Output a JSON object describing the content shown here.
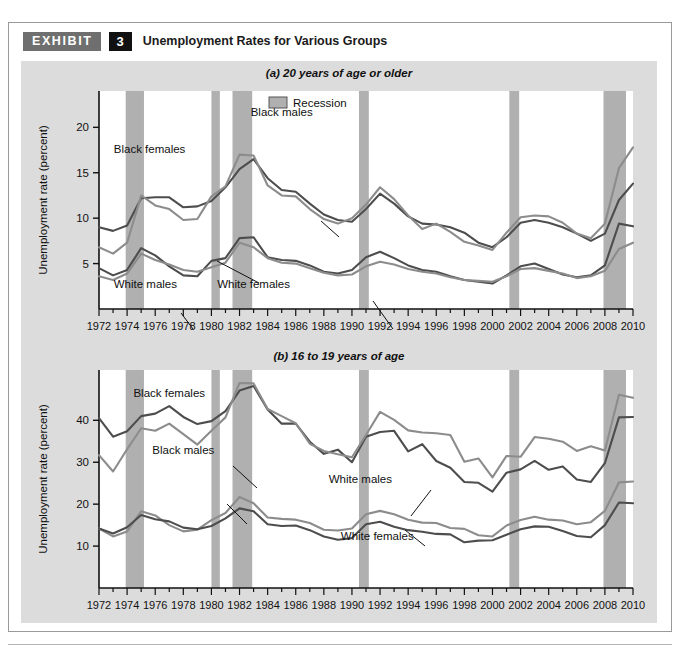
{
  "exhibit": {
    "badge_label": "EXHIBIT",
    "number": "3",
    "title": "Unemployment Rates for Various Groups"
  },
  "legend": {
    "recession_label": "Recession",
    "recession_color": "#b0b0b0"
  },
  "series_colors": {
    "black_females": "#4d4d4d",
    "black_males": "#8c8c8c",
    "white_males": "#4d4d4d",
    "white_females": "#8c8c8c",
    "axis": "#111111",
    "plot_bg": "#ffffff"
  },
  "chart_data": [
    {
      "type": "line",
      "title": "(a) 20 years of age or older",
      "panel_letter": "(a)",
      "panel_text": "20 years of age or older",
      "xlabel": "",
      "ylabel": "Unemployment rate (percent)",
      "xlim": [
        1972,
        2010
      ],
      "ylim": [
        0,
        24
      ],
      "yticks": [
        5,
        10,
        15,
        20
      ],
      "xticks": [
        1972,
        1974,
        1976,
        1978,
        1980,
        1982,
        1984,
        1986,
        1988,
        1990,
        1992,
        1994,
        1996,
        1998,
        2000,
        2002,
        2004,
        2006,
        2008,
        2010
      ],
      "xticklabels": [
        "1972",
        "1974",
        "1976",
        "1978",
        "1980",
        "1982",
        "1984",
        "1986",
        "1988",
        "1990",
        "1992",
        "1994",
        "1996",
        "1998",
        "2000",
        "2002",
        "2004",
        "2006",
        "2008",
        "2010"
      ],
      "grid": false,
      "legend_position": "top-center",
      "annotations": [
        {
          "text": "Black males",
          "x": 1985.0,
          "y": 21.2
        },
        {
          "text": "Black females",
          "x": 1975.6,
          "y": 17.2
        },
        {
          "text": "White males",
          "x": 1975.3,
          "y": 2.3
        },
        {
          "text": "White females",
          "x": 1983.0,
          "y": 2.3
        }
      ],
      "recessions": [
        {
          "start": 1973.9,
          "end": 1975.2
        },
        {
          "start": 1980.0,
          "end": 1980.6
        },
        {
          "start": 1981.5,
          "end": 1982.9
        },
        {
          "start": 1990.5,
          "end": 1991.2
        },
        {
          "start": 2001.2,
          "end": 2001.9
        },
        {
          "start": 2007.9,
          "end": 2009.5
        }
      ],
      "x": [
        1972,
        1973,
        1974,
        1975,
        1976,
        1977,
        1978,
        1979,
        1980,
        1981,
        1982,
        1983,
        1984,
        1985,
        1986,
        1987,
        1988,
        1989,
        1990,
        1991,
        1992,
        1993,
        1994,
        1995,
        1996,
        1997,
        1998,
        1999,
        2000,
        2001,
        2002,
        2003,
        2004,
        2005,
        2006,
        2007,
        2008,
        2009,
        2010
      ],
      "series": [
        {
          "name": "Black females",
          "color": "#4d4d4d",
          "values": [
            9.0,
            8.6,
            9.2,
            12.2,
            12.3,
            12.3,
            11.2,
            11.3,
            11.9,
            13.4,
            15.4,
            16.5,
            14.4,
            13.1,
            12.9,
            11.6,
            10.4,
            9.8,
            9.6,
            11.0,
            12.7,
            11.6,
            10.2,
            9.4,
            9.3,
            9.0,
            8.4,
            7.3,
            6.8,
            7.9,
            9.5,
            9.8,
            9.5,
            9.0,
            8.3,
            7.5,
            8.3,
            12.0,
            13.8
          ]
        },
        {
          "name": "Black males",
          "color": "#8c8c8c",
          "values": [
            6.8,
            6.1,
            7.3,
            12.5,
            11.4,
            11.0,
            9.8,
            9.9,
            12.4,
            13.5,
            17.0,
            16.9,
            13.6,
            12.5,
            12.4,
            11.0,
            9.9,
            9.4,
            10.0,
            11.5,
            13.4,
            12.1,
            10.3,
            8.8,
            9.4,
            8.5,
            7.4,
            7.0,
            6.5,
            8.4,
            10.1,
            10.3,
            10.2,
            9.5,
            8.3,
            7.8,
            9.4,
            15.5,
            17.8
          ]
        },
        {
          "name": "White males",
          "color": "#4d4d4d",
          "values": [
            4.5,
            3.7,
            4.3,
            6.7,
            5.9,
            4.7,
            3.7,
            3.6,
            5.3,
            5.6,
            7.8,
            7.9,
            5.7,
            5.4,
            5.3,
            4.8,
            4.1,
            3.9,
            4.3,
            5.7,
            6.3,
            5.6,
            4.8,
            4.3,
            4.1,
            3.6,
            3.2,
            3.0,
            2.8,
            3.7,
            4.7,
            5.0,
            4.4,
            3.8,
            3.5,
            3.7,
            4.8,
            9.4,
            9.1
          ]
        },
        {
          "name": "White females",
          "color": "#8c8c8c",
          "values": [
            3.6,
            3.2,
            3.9,
            6.1,
            5.4,
            4.9,
            4.3,
            4.1,
            4.6,
            5.1,
            7.3,
            6.8,
            5.6,
            5.1,
            5.0,
            4.5,
            4.0,
            3.7,
            3.8,
            4.7,
            5.2,
            4.9,
            4.4,
            4.1,
            3.9,
            3.5,
            3.2,
            3.1,
            3.0,
            3.6,
            4.4,
            4.5,
            4.2,
            3.9,
            3.4,
            3.6,
            4.2,
            6.6,
            7.3
          ]
        }
      ]
    },
    {
      "type": "line",
      "title": "(b) 16 to 19 years of age",
      "panel_letter": "(b)",
      "panel_text": "16 to 19 years of age",
      "xlabel": "",
      "ylabel": "Unemployment rate (percent)",
      "xlim": [
        1972,
        2010
      ],
      "ylim": [
        0,
        52
      ],
      "yticks": [
        10,
        20,
        30,
        40
      ],
      "xticks": [
        1972,
        1974,
        1976,
        1978,
        1980,
        1982,
        1984,
        1986,
        1988,
        1990,
        1992,
        1994,
        1996,
        1998,
        2000,
        2002,
        2004,
        2006,
        2008,
        2010
      ],
      "xticklabels": [
        "1972",
        "1974",
        "1976",
        "1978",
        "1980",
        "1982",
        "1984",
        "1986",
        "1988",
        "1990",
        "1992",
        "1994",
        "1996",
        "1998",
        "2000",
        "2002",
        "2004",
        "2006",
        "2008",
        "2010"
      ],
      "grid": false,
      "legend_position": "none",
      "annotations": [
        {
          "text": "Black females",
          "x": 1977.0,
          "y": 45.5
        },
        {
          "text": "Black males",
          "x": 1978.0,
          "y": 32.0
        },
        {
          "text": "White males",
          "x": 1990.6,
          "y": 25.0
        },
        {
          "text": "White females",
          "x": 1991.8,
          "y": 11.5
        }
      ],
      "recessions": [
        {
          "start": 1973.9,
          "end": 1975.2
        },
        {
          "start": 1980.0,
          "end": 1980.6
        },
        {
          "start": 1981.5,
          "end": 1982.9
        },
        {
          "start": 1990.5,
          "end": 1991.2
        },
        {
          "start": 2001.2,
          "end": 2001.9
        },
        {
          "start": 2007.9,
          "end": 2009.5
        }
      ],
      "x": [
        1972,
        1973,
        1974,
        1975,
        1976,
        1977,
        1978,
        1979,
        1980,
        1981,
        1982,
        1983,
        1984,
        1985,
        1986,
        1987,
        1988,
        1989,
        1990,
        1991,
        1992,
        1993,
        1994,
        1995,
        1996,
        1997,
        1998,
        1999,
        2000,
        2001,
        2002,
        2003,
        2004,
        2005,
        2006,
        2007,
        2008,
        2009,
        2010
      ],
      "series": [
        {
          "name": "Black females",
          "color": "#4d4d4d",
          "values": [
            40.5,
            36.1,
            37.4,
            41.0,
            41.6,
            43.4,
            40.8,
            39.1,
            39.8,
            42.2,
            47.1,
            48.2,
            42.6,
            39.2,
            39.2,
            34.9,
            32.0,
            33.0,
            30.0,
            36.1,
            37.2,
            37.5,
            32.6,
            34.3,
            30.3,
            28.7,
            25.3,
            25.1,
            23.0,
            27.5,
            28.3,
            30.3,
            28.2,
            29.0,
            25.9,
            25.3,
            29.8,
            40.7,
            40.8
          ]
        },
        {
          "name": "Black males",
          "color": "#8c8c8c",
          "values": [
            31.7,
            27.8,
            33.1,
            38.1,
            37.5,
            39.2,
            36.7,
            34.2,
            37.5,
            40.7,
            48.9,
            48.8,
            42.7,
            41.0,
            39.3,
            34.4,
            32.7,
            31.9,
            31.2,
            36.5,
            42.0,
            40.1,
            37.6,
            37.1,
            36.9,
            36.5,
            30.1,
            30.9,
            26.4,
            31.5,
            31.3,
            36.0,
            35.6,
            34.9,
            32.7,
            33.8,
            32.8,
            46.1,
            45.4
          ]
        },
        {
          "name": "White males",
          "color": "#8c8c8c",
          "values": [
            14.2,
            12.3,
            13.5,
            18.3,
            17.3,
            15.0,
            13.5,
            13.9,
            16.2,
            17.9,
            21.7,
            20.2,
            16.8,
            16.5,
            16.3,
            15.5,
            13.9,
            13.7,
            14.2,
            17.6,
            18.4,
            17.6,
            16.3,
            15.6,
            15.5,
            14.3,
            14.1,
            12.6,
            12.3,
            14.9,
            16.2,
            17.0,
            16.3,
            16.1,
            15.2,
            15.7,
            18.4,
            25.2,
            25.4
          ]
        },
        {
          "name": "White females",
          "color": "#4d4d4d",
          "values": [
            14.2,
            13.0,
            14.5,
            17.4,
            16.4,
            15.9,
            14.4,
            14.0,
            14.8,
            16.6,
            19.0,
            18.3,
            15.2,
            14.8,
            14.9,
            13.8,
            12.3,
            11.5,
            11.9,
            15.2,
            15.8,
            14.6,
            13.8,
            13.4,
            12.9,
            12.8,
            10.9,
            11.3,
            11.4,
            12.7,
            14.0,
            14.7,
            14.6,
            13.6,
            12.4,
            12.1,
            15.0,
            20.4,
            20.2
          ]
        }
      ]
    }
  ]
}
